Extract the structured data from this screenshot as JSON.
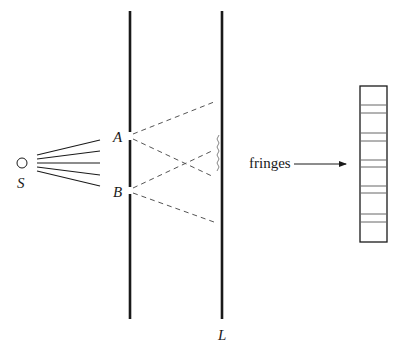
{
  "diagram": {
    "colors": {
      "ink": "#1a1a1a",
      "dashed": "#555555",
      "fringe_line": "#666666",
      "background": "#ffffff"
    },
    "labels": {
      "source": "S",
      "slit_a": "A",
      "slit_b": "B",
      "screen": "L",
      "fringes": "fringes"
    },
    "source": {
      "cx": 22,
      "cy": 163,
      "r": 5
    },
    "source_rays": [
      {
        "x1": 37,
        "y1": 155,
        "x2": 100,
        "y2": 140
      },
      {
        "x1": 37,
        "y1": 159,
        "x2": 100,
        "y2": 151
      },
      {
        "x1": 37,
        "y1": 163,
        "x2": 100,
        "y2": 163
      },
      {
        "x1": 37,
        "y1": 167,
        "x2": 100,
        "y2": 175
      },
      {
        "x1": 37,
        "y1": 171,
        "x2": 100,
        "y2": 186
      }
    ],
    "barrier": {
      "x": 130,
      "y_top": 11,
      "y_bottom": 319,
      "slit_a": [
        132,
        140
      ],
      "slit_b": [
        187,
        194
      ]
    },
    "screen": {
      "x": 222,
      "y_top": 11,
      "y_bottom": 319
    },
    "wave_paths": [
      {
        "from": "A",
        "x1": 133,
        "y1": 134,
        "x2": 214,
        "y2": 102
      },
      {
        "from": "A",
        "x1": 133,
        "y1": 139,
        "x2": 214,
        "y2": 177
      },
      {
        "from": "B",
        "x1": 133,
        "y1": 188,
        "x2": 214,
        "y2": 150
      },
      {
        "from": "B",
        "x1": 133,
        "y1": 193,
        "x2": 214,
        "y2": 222
      }
    ],
    "fringe_panel": {
      "x": 360,
      "y": 86,
      "width": 27,
      "height": 156,
      "line_ys": [
        105,
        113,
        133,
        141,
        160,
        167,
        186,
        193,
        214,
        222
      ]
    },
    "arrow": {
      "x1": 294,
      "y1": 164,
      "x2": 346,
      "y2": 164
    }
  }
}
